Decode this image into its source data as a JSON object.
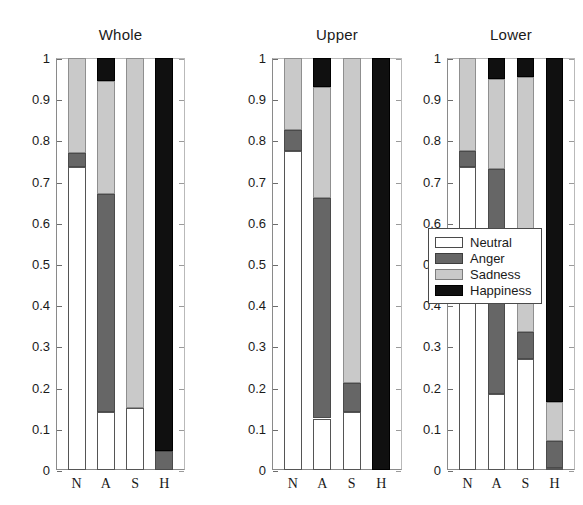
{
  "chart_data": {
    "type": "bar",
    "title": "",
    "subtitle": "",
    "stacked": true,
    "categories": [
      "N",
      "A",
      "S",
      "H"
    ],
    "xlabel": "",
    "ylabel": "",
    "ylim": [
      0,
      1
    ],
    "ytick_labels": [
      "0",
      "0.1",
      "0.2",
      "0.3",
      "0.4",
      "0.5",
      "0.6",
      "0.7",
      "0.8",
      "0.9",
      "1"
    ],
    "ytick_values": [
      0,
      0.1,
      0.2,
      0.3,
      0.4,
      0.5,
      0.6,
      0.7,
      0.8,
      0.9,
      1
    ],
    "grid": false,
    "legend_position": "center-right",
    "legend_entries": [
      "Neutral",
      "Anger",
      "Sadness",
      "Happiness"
    ],
    "series_colors": {
      "Neutral": "#ffffff",
      "Anger": "#666666",
      "Sadness": "#c9c9c9",
      "Happiness": "#101010"
    },
    "panels": [
      {
        "title": "Whole",
        "series": [
          {
            "name": "Neutral",
            "values": [
              0.735,
              0.14,
              0.15,
              0.0
            ]
          },
          {
            "name": "Anger",
            "values": [
              0.035,
              0.53,
              0.0,
              0.045
            ]
          },
          {
            "name": "Sadness",
            "values": [
              0.23,
              0.275,
              0.85,
              0.0
            ]
          },
          {
            "name": "Happiness",
            "values": [
              0.0,
              0.055,
              0.0,
              0.955
            ]
          }
        ]
      },
      {
        "title": "Upper",
        "series": [
          {
            "name": "Neutral",
            "values": [
              0.775,
              0.125,
              0.14,
              0.0
            ]
          },
          {
            "name": "Anger",
            "values": [
              0.05,
              0.535,
              0.07,
              0.0
            ]
          },
          {
            "name": "Sadness",
            "values": [
              0.175,
              0.27,
              0.79,
              0.0
            ]
          },
          {
            "name": "Happiness",
            "values": [
              0.0,
              0.07,
              0.0,
              1.0
            ]
          }
        ]
      },
      {
        "title": "Lower",
        "series": [
          {
            "name": "Neutral",
            "values": [
              0.735,
              0.185,
              0.27,
              0.005
            ]
          },
          {
            "name": "Anger",
            "values": [
              0.04,
              0.545,
              0.065,
              0.065
            ]
          },
          {
            "name": "Sadness",
            "values": [
              0.225,
              0.22,
              0.62,
              0.095
            ]
          },
          {
            "name": "Happiness",
            "values": [
              0.0,
              0.05,
              0.045,
              0.835
            ]
          }
        ]
      }
    ]
  }
}
